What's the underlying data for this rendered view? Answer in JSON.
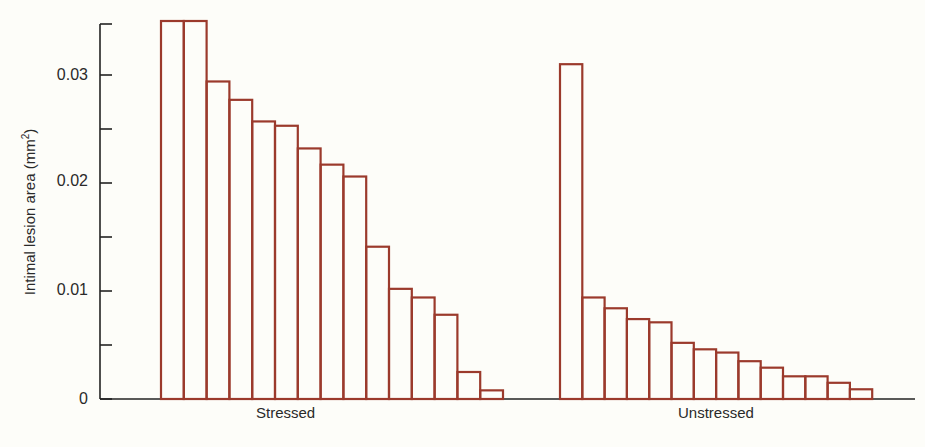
{
  "chart_data": {
    "type": "bar",
    "title": "",
    "xlabel": "",
    "ylabel": "Intimal lesion area (mm²)",
    "ylabel_base": "Intimal lesion area (mm",
    "ylabel_sup": "2",
    "ylabel_tail": ")",
    "ylim": [
      0,
      0.035
    ],
    "yticks": [
      0,
      0.01,
      0.02,
      0.03
    ],
    "ytick_labels": [
      "0",
      "0.01",
      "0.02",
      "0.03"
    ],
    "minor_yticks": [
      0.005,
      0.015,
      0.025
    ],
    "grid": false,
    "legend": null,
    "bar_color": "#9b3a2c",
    "groups": [
      {
        "name": "Stressed",
        "values": [
          0.035,
          0.035,
          0.0294,
          0.0277,
          0.0257,
          0.0253,
          0.0232,
          0.0217,
          0.0206,
          0.0141,
          0.0102,
          0.0094,
          0.0078,
          0.0025,
          0.0008
        ]
      },
      {
        "name": "Unstressed",
        "values": [
          0.031,
          0.0094,
          0.0084,
          0.0074,
          0.0071,
          0.0052,
          0.0046,
          0.0043,
          0.0035,
          0.0029,
          0.0021,
          0.0021,
          0.0015,
          0.0009
        ]
      }
    ],
    "categories": [
      "Stressed",
      "Unstressed"
    ]
  }
}
